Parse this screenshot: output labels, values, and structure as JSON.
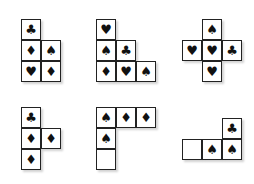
{
  "cell_size": 20,
  "shapes": [
    {
      "name": "shape-1",
      "x": 21,
      "y": 19,
      "cells": [
        {
          "c": 0,
          "r": 0,
          "s": "♣"
        },
        {
          "c": 0,
          "r": 1,
          "s": "♦"
        },
        {
          "c": 1,
          "r": 1,
          "s": "♠"
        },
        {
          "c": 0,
          "r": 2,
          "s": "♥"
        },
        {
          "c": 1,
          "r": 2,
          "s": "♦"
        }
      ]
    },
    {
      "name": "shape-2",
      "x": 96,
      "y": 19,
      "cells": [
        {
          "c": 0,
          "r": 0,
          "s": "♥"
        },
        {
          "c": 0,
          "r": 1,
          "s": "♠"
        },
        {
          "c": 1,
          "r": 1,
          "s": "♣"
        },
        {
          "c": 0,
          "r": 2,
          "s": "♦"
        },
        {
          "c": 1,
          "r": 2,
          "s": "♥"
        },
        {
          "c": 2,
          "r": 2,
          "s": "♠"
        }
      ]
    },
    {
      "name": "shape-3",
      "x": 182,
      "y": 19,
      "cells": [
        {
          "c": 1,
          "r": 0,
          "s": "♠"
        },
        {
          "c": 0,
          "r": 1,
          "s": "♥"
        },
        {
          "c": 1,
          "r": 1,
          "s": "♥"
        },
        {
          "c": 2,
          "r": 1,
          "s": "♣"
        },
        {
          "c": 1,
          "r": 2,
          "s": "♥"
        }
      ]
    },
    {
      "name": "shape-4",
      "x": 21,
      "y": 107,
      "cells": [
        {
          "c": 0,
          "r": 0,
          "s": "♣"
        },
        {
          "c": 0,
          "r": 1,
          "s": "♦"
        },
        {
          "c": 1,
          "r": 1,
          "s": "♦"
        },
        {
          "c": 0,
          "r": 2,
          "s": "♦"
        }
      ]
    },
    {
      "name": "shape-5",
      "x": 96,
      "y": 107,
      "cells": [
        {
          "c": 0,
          "r": 0,
          "s": "♠"
        },
        {
          "c": 1,
          "r": 0,
          "s": "♦"
        },
        {
          "c": 2,
          "r": 0,
          "s": "♦"
        },
        {
          "c": 0,
          "r": 1,
          "s": "♠"
        },
        {
          "c": 0,
          "r": 2,
          "s": ""
        }
      ]
    },
    {
      "name": "shape-6",
      "x": 182,
      "y": 118,
      "cells": [
        {
          "c": 2,
          "r": 0,
          "s": "♣"
        },
        {
          "c": 0,
          "r": 1,
          "s": ""
        },
        {
          "c": 1,
          "r": 1,
          "s": "♠"
        },
        {
          "c": 2,
          "r": 1,
          "s": "♠"
        }
      ]
    }
  ]
}
